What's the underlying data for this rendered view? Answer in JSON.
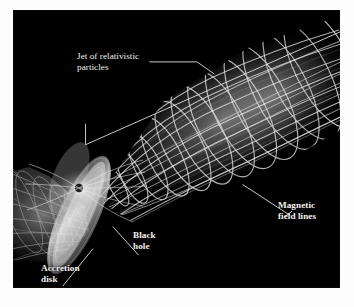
{
  "figure": {
    "type": "astronomy-illustration",
    "background_color": "#000000",
    "page_color": "#ffffff",
    "label_color": "#f4f2ee",
    "structure_color": "#d8d8d8"
  },
  "labels": {
    "jet": "Jet of relativistic\nparticles",
    "magnetic": "Magnetic\nfield lines",
    "black_hole": "Black\nhole",
    "accretion": "Accretion\ndisk"
  },
  "annotations": {
    "jet_bracket": "bracket-spanning-jet",
    "jet_leader": "leader-line-jet",
    "magnetic_leader": "leader-line-magnetic-field",
    "black_hole_leader": "leader-line-black-hole",
    "accretion_leader": "leader-line-accretion-disk"
  },
  "elements": {
    "main_jet": "upper-right-relativistic-jet",
    "counter_jet": "lower-left-counter-jet",
    "accretion_disk": "central-accretion-disk",
    "black_hole": "central-black-hole",
    "field_lines": "helical-magnetic-field-lines"
  }
}
